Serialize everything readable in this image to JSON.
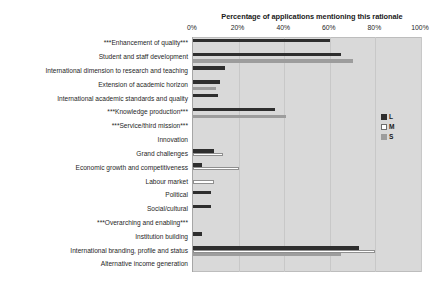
{
  "chart_data": {
    "type": "bar",
    "orientation": "horizontal",
    "title": "Percentage of applications mentioning this rationale",
    "xlabel": "",
    "ylabel": "",
    "xlim": [
      0,
      100
    ],
    "xticks": [
      "0%",
      "20%",
      "40%",
      "60%",
      "80%",
      "100%"
    ],
    "xtick_values": [
      0,
      20,
      40,
      60,
      80,
      100
    ],
    "grid": true,
    "legend_position": "right",
    "plot_background": "#d9d9d9",
    "categories": [
      "***Enhancement of quality***",
      "Student and staff development",
      "International dimension to research and teaching",
      "Extension of academic horizon",
      "International academic standards and quality",
      "***Knowledge production***",
      "***Service/third mission***",
      "Innovation",
      "Grand challenges",
      "Economic growth and competitiveness",
      "Labour market",
      "Political",
      "Social/cultural",
      "***Overarching and enabling***",
      "Institution building",
      "International branding, profile and status",
      "Alternative income generation"
    ],
    "series": [
      {
        "name": "L",
        "color": "#2e2e2e",
        "values": [
          60,
          65,
          14,
          12,
          11,
          36,
          0,
          0,
          9,
          4,
          0,
          8,
          8,
          0,
          4,
          73,
          0
        ]
      },
      {
        "name": "M",
        "color": "#ffffff",
        "values": [
          0,
          0,
          0,
          0,
          0,
          0,
          0,
          0,
          13,
          20,
          9,
          0,
          0,
          0,
          0,
          80,
          0
        ]
      },
      {
        "name": "S",
        "color": "#9d9d9d",
        "values": [
          0,
          70,
          0,
          10,
          0,
          41,
          0,
          0,
          0,
          0,
          0,
          0,
          0,
          0,
          0,
          65,
          0
        ]
      }
    ]
  },
  "legend": {
    "items": [
      {
        "label": "L",
        "key": "L"
      },
      {
        "label": "M",
        "key": "M"
      },
      {
        "label": "S",
        "key": "S"
      }
    ]
  }
}
